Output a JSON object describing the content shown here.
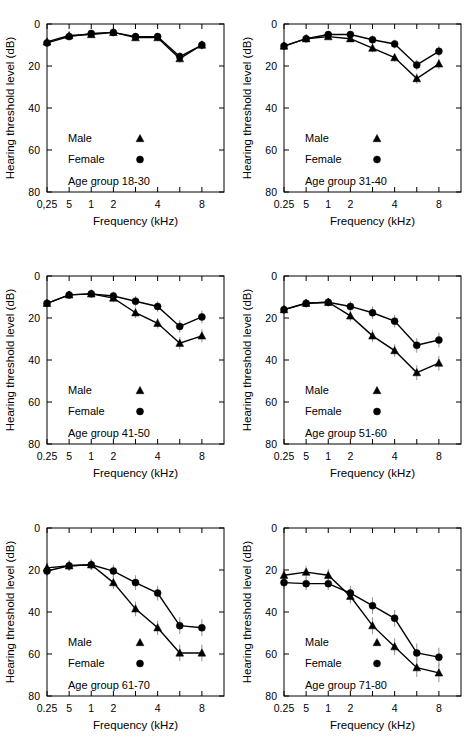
{
  "figure": {
    "axis": {
      "ylabel": "Hearing threshold level (dB)",
      "xlabel": "Frequency (kHz)",
      "yticks": [
        "0",
        "20",
        "40",
        "60",
        "80"
      ],
      "ylim": [
        0,
        80
      ],
      "y_inverted": true,
      "xticks": [
        "0.25",
        "5",
        "1",
        "2",
        "4",
        "8"
      ],
      "xticks_panel1": [
        "0,25",
        "5",
        "1",
        "2",
        "4",
        "8"
      ],
      "xtick_positions": [
        0,
        1,
        2,
        3,
        5,
        7
      ],
      "xlim": [
        0,
        8
      ],
      "grid": false
    },
    "legend": {
      "male_label": "Male",
      "female_label": "Female",
      "male_marker": "triangle",
      "female_marker": "circle",
      "position": "inside-lower-left"
    },
    "colors": {
      "ink": "#000000",
      "errorbar": "#9a9a9a",
      "background": "#ffffff"
    }
  },
  "chart_data": [
    {
      "type": "line",
      "title": "Age group 18-30",
      "panel_index": 0,
      "xlabel": "Frequency (kHz)",
      "ylabel": "Hearing threshold level (dB)",
      "x": [
        0.25,
        0.5,
        1,
        2,
        3,
        4,
        6,
        8
      ],
      "x_positions": [
        0,
        1,
        2,
        3,
        4,
        5,
        6,
        7
      ],
      "ylim": [
        0,
        80
      ],
      "y_inverted": true,
      "series": [
        {
          "name": "Male",
          "marker": "triangle",
          "values": [
            8.5,
            5.5,
            5.0,
            4.0,
            6.5,
            6.5,
            16.5,
            10.0
          ],
          "errors": [
            1.5,
            1.5,
            1.5,
            1.5,
            1.5,
            1.5,
            2.0,
            2.0
          ]
        },
        {
          "name": "Female",
          "marker": "circle",
          "values": [
            9.0,
            6.0,
            4.5,
            4.0,
            6.0,
            6.0,
            15.5,
            10.0
          ],
          "errors": [
            1.5,
            1.5,
            1.5,
            1.5,
            1.5,
            1.5,
            2.0,
            2.0
          ]
        }
      ]
    },
    {
      "type": "line",
      "title": "Age group 31-40",
      "panel_index": 1,
      "xlabel": "Frequency (kHz)",
      "ylabel": "Hearing threshold level (dB)",
      "x": [
        0.25,
        0.5,
        1,
        2,
        3,
        4,
        6,
        8
      ],
      "x_positions": [
        0,
        1,
        2,
        3,
        4,
        5,
        6,
        7
      ],
      "ylim": [
        0,
        80
      ],
      "y_inverted": true,
      "series": [
        {
          "name": "Male",
          "marker": "triangle",
          "values": [
            10.5,
            7.0,
            6.0,
            7.0,
            11.5,
            16.0,
            26.0,
            19.0
          ],
          "errors": [
            1.5,
            1.5,
            1.5,
            1.5,
            2.0,
            2.0,
            2.5,
            2.5
          ]
        },
        {
          "name": "Female",
          "marker": "circle",
          "values": [
            10.5,
            7.0,
            5.0,
            5.0,
            7.5,
            9.5,
            19.5,
            13.0
          ],
          "errors": [
            1.5,
            1.5,
            1.5,
            1.5,
            2.0,
            2.0,
            2.5,
            2.5
          ]
        }
      ]
    },
    {
      "type": "line",
      "title": "Age group 41-50",
      "panel_index": 2,
      "xlabel": "Frequency (kHz)",
      "ylabel": "Hearing threshold level (dB)",
      "x": [
        0.25,
        0.5,
        1,
        2,
        3,
        4,
        6,
        8
      ],
      "x_positions": [
        0,
        1,
        2,
        3,
        4,
        5,
        6,
        7
      ],
      "ylim": [
        0,
        80
      ],
      "y_inverted": true,
      "series": [
        {
          "name": "Male",
          "marker": "triangle",
          "values": [
            13.0,
            9.0,
            8.5,
            10.5,
            17.5,
            22.5,
            32.0,
            28.5
          ],
          "errors": [
            1.5,
            1.5,
            1.5,
            2.0,
            2.5,
            2.5,
            3.0,
            3.0
          ]
        },
        {
          "name": "Female",
          "marker": "circle",
          "values": [
            13.0,
            9.0,
            8.5,
            9.5,
            12.0,
            14.5,
            24.0,
            19.5
          ],
          "errors": [
            1.5,
            1.5,
            1.5,
            2.0,
            2.5,
            2.5,
            3.0,
            3.0
          ]
        }
      ]
    },
    {
      "type": "line",
      "title": "Age group 51-60",
      "panel_index": 3,
      "xlabel": "Frequency (kHz)",
      "ylabel": "Hearing threshold level (dB)",
      "x": [
        0.25,
        0.5,
        1,
        2,
        3,
        4,
        6,
        8
      ],
      "x_positions": [
        0,
        1,
        2,
        3,
        4,
        5,
        6,
        7
      ],
      "ylim": [
        0,
        80
      ],
      "y_inverted": true,
      "series": [
        {
          "name": "Male",
          "marker": "triangle",
          "values": [
            16.0,
            13.0,
            12.5,
            19.0,
            28.5,
            35.5,
            46.0,
            41.5
          ],
          "errors": [
            2.0,
            2.0,
            2.0,
            2.5,
            3.0,
            3.0,
            3.5,
            3.5
          ]
        },
        {
          "name": "Female",
          "marker": "circle",
          "values": [
            16.0,
            13.0,
            12.5,
            14.5,
            17.5,
            21.5,
            33.0,
            30.5
          ],
          "errors": [
            2.0,
            2.0,
            2.0,
            2.5,
            3.0,
            3.0,
            3.5,
            3.5
          ]
        }
      ]
    },
    {
      "type": "line",
      "title": "Age group 61-70",
      "panel_index": 4,
      "xlabel": "Frequency (kHz)",
      "ylabel": "Hearing threshold level (dB)",
      "x": [
        0.25,
        0.5,
        1,
        2,
        3,
        4,
        6,
        8
      ],
      "x_positions": [
        0,
        1,
        2,
        3,
        4,
        5,
        6,
        7
      ],
      "ylim": [
        0,
        80
      ],
      "y_inverted": true,
      "series": [
        {
          "name": "Male",
          "marker": "triangle",
          "values": [
            19.0,
            18.0,
            17.5,
            26.0,
            38.5,
            47.5,
            59.5,
            59.5
          ],
          "errors": [
            2.5,
            2.5,
            2.5,
            3.0,
            3.5,
            3.5,
            4.0,
            4.0
          ]
        },
        {
          "name": "Female",
          "marker": "circle",
          "values": [
            20.5,
            18.0,
            17.5,
            20.5,
            26.0,
            31.0,
            46.5,
            47.5
          ],
          "errors": [
            2.5,
            2.5,
            2.5,
            3.0,
            3.5,
            3.5,
            4.0,
            4.0
          ]
        }
      ]
    },
    {
      "type": "line",
      "title": "Age group 71-80",
      "panel_index": 5,
      "xlabel": "Frequency (kHz)",
      "ylabel": "Hearing threshold level (dB)",
      "x": [
        0.25,
        0.5,
        1,
        2,
        3,
        4,
        6,
        8
      ],
      "x_positions": [
        0,
        1,
        2,
        3,
        4,
        5,
        6,
        7
      ],
      "ylim": [
        0,
        80
      ],
      "y_inverted": true,
      "series": [
        {
          "name": "Male",
          "marker": "triangle",
          "values": [
            22.5,
            21.0,
            22.5,
            32.5,
            46.5,
            56.5,
            66.5,
            69.0
          ],
          "errors": [
            3.0,
            3.0,
            3.0,
            3.5,
            4.0,
            4.0,
            4.5,
            4.5
          ]
        },
        {
          "name": "Female",
          "marker": "circle",
          "values": [
            26.0,
            26.5,
            26.5,
            31.0,
            37.0,
            43.0,
            59.5,
            61.5
          ],
          "errors": [
            3.0,
            3.0,
            3.0,
            3.5,
            4.0,
            4.0,
            4.5,
            4.5
          ]
        }
      ]
    }
  ]
}
